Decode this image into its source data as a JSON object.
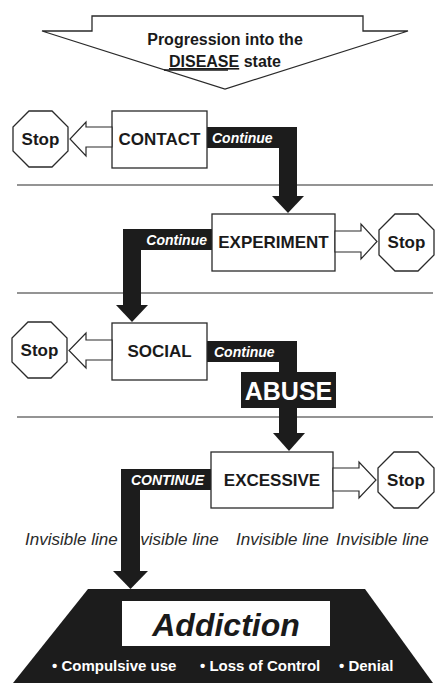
{
  "header": {
    "line1": "Progression into the",
    "line2_underlined": "DISEASE",
    "line2_rest": " state"
  },
  "stages": [
    {
      "label": "CONTACT",
      "stop_label": "Stop",
      "stop_side": "left",
      "continue_label": "Continue"
    },
    {
      "label": "EXPERIMENT",
      "stop_label": "Stop",
      "stop_side": "right",
      "continue_label": "Continue"
    },
    {
      "label": "SOCIAL",
      "stop_label": "Stop",
      "stop_side": "left",
      "continue_label": "Continue"
    },
    {
      "label": "EXCESSIVE",
      "stop_label": "Stop",
      "stop_side": "right",
      "continue_label": "CONTINUE"
    }
  ],
  "abuse_label": "ABUSE",
  "invisible_line": [
    "Invisible line",
    "Invisible line",
    "Invisible line",
    "Invisible line"
  ],
  "addiction": {
    "title": "Addiction",
    "bullets": [
      "• Compulsive use",
      "• Loss of Control",
      "• Denial"
    ]
  },
  "colors": {
    "band": "#1c1c1c",
    "stroke": "#2a2a2a",
    "background": "#ffffff"
  }
}
